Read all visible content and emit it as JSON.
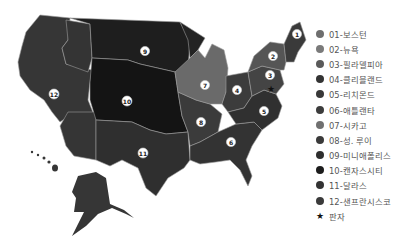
{
  "map": {
    "title": "",
    "colors": {
      "d1": "#3a3a3a",
      "d2": "#555555",
      "d3": "#444444",
      "d4": "#3c3c3c",
      "d5": "#303030",
      "d6": "#333333",
      "d7": "#6a6a6a",
      "d8": "#3b3b3b",
      "d9": "#1e1e1e",
      "d10": "#141414",
      "d11": "#2f2f2f",
      "d12": "#363636"
    },
    "markers": [
      {
        "num": "1",
        "x": 297,
        "y": 34
      },
      {
        "num": "2",
        "x": 273,
        "y": 56
      },
      {
        "num": "3",
        "x": 270,
        "y": 75
      },
      {
        "num": "4",
        "x": 237,
        "y": 90
      },
      {
        "num": "5",
        "x": 264,
        "y": 111
      },
      {
        "num": "6",
        "x": 231,
        "y": 142
      },
      {
        "num": "7",
        "x": 205,
        "y": 85
      },
      {
        "num": "8",
        "x": 201,
        "y": 122
      },
      {
        "num": "9",
        "x": 145,
        "y": 51
      },
      {
        "num": "10",
        "x": 127,
        "y": 101
      },
      {
        "num": "11",
        "x": 143,
        "y": 153
      },
      {
        "num": "12",
        "x": 54,
        "y": 94
      }
    ],
    "reserve_star": {
      "x": 271,
      "y": 89,
      "glyph": "★"
    }
  },
  "legend": {
    "items": [
      {
        "label": "01-보스턴",
        "color": "#6e6e6e"
      },
      {
        "label": "02-뉴욕",
        "color": "#7a7a7a"
      },
      {
        "label": "03-필라델피아",
        "color": "#5a5a5a"
      },
      {
        "label": "04-클리블랜드",
        "color": "#333333"
      },
      {
        "label": "05-리치몬드",
        "color": "#383838"
      },
      {
        "label": "06-애틀랜타",
        "color": "#3c3c3c"
      },
      {
        "label": "07-시카고",
        "color": "#707070"
      },
      {
        "label": "08-성. 루이",
        "color": "#3a3a3a"
      },
      {
        "label": "09-미니애폴리스",
        "color": "#2e2e2e"
      },
      {
        "label": "10-캔자스시티",
        "color": "#1c1c1c"
      },
      {
        "label": "11-달라스",
        "color": "#333333"
      },
      {
        "label": "12-샌프란시스코",
        "color": "#3a3a3a"
      }
    ],
    "star_label": "판자",
    "star_glyph": "★"
  }
}
